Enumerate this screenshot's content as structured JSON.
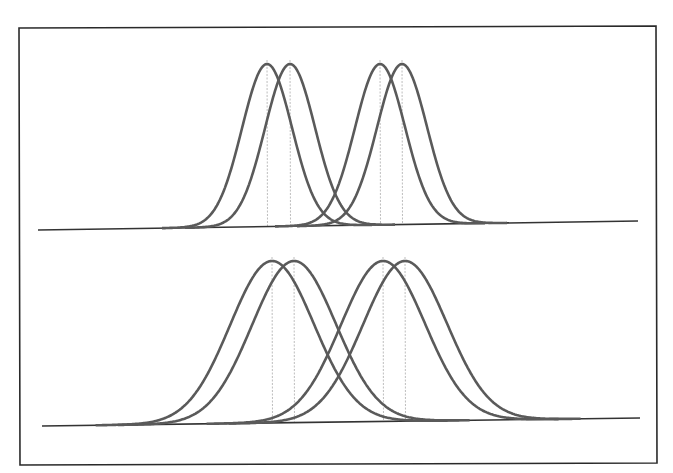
{
  "figure": {
    "width": 673,
    "height": 473,
    "frame": {
      "x1": 19,
      "y1": 27,
      "x2": 656,
      "y2": 464
    },
    "colors": {
      "frame": "#2a2a2a",
      "baseline": "#333333",
      "curve": "#5a5a5a",
      "mean_line": "#bdbdbd",
      "background": "#ffffff"
    },
    "panels": [
      {
        "name": "top-panel-narrow-distributions",
        "baseline": {
          "x1": 38,
          "y1": 230,
          "x2": 638,
          "y2": 221
        },
        "peak_y": 64,
        "sigma": 25,
        "means": [
          267,
          290,
          380,
          402
        ]
      },
      {
        "name": "bottom-panel-wide-distributions",
        "baseline": {
          "x1": 42,
          "y1": 426,
          "x2": 640,
          "y2": 418
        },
        "peak_y": 261,
        "sigma": 42,
        "means": [
          272,
          294,
          383,
          405
        ]
      }
    ]
  }
}
